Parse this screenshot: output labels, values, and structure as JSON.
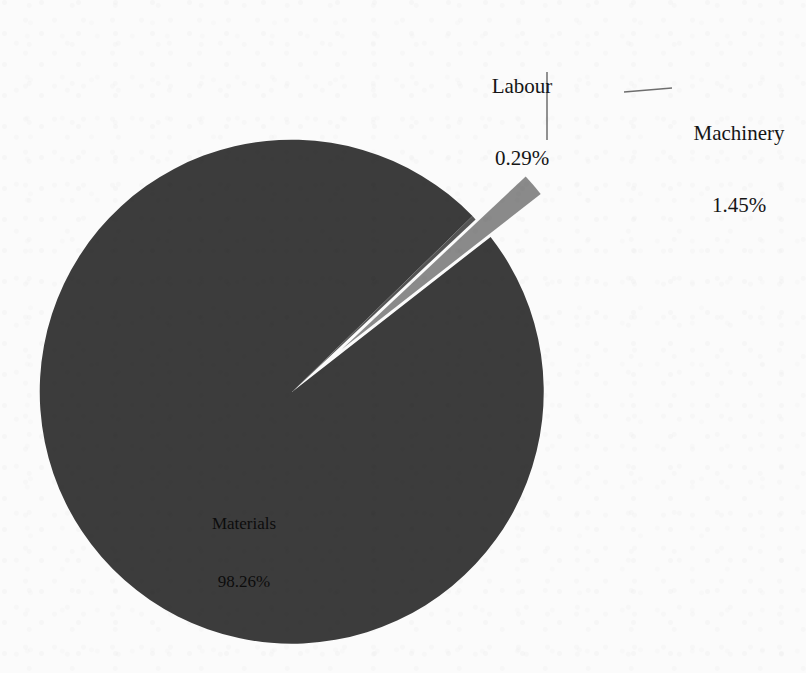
{
  "chart_data": {
    "type": "pie",
    "title": "",
    "subtitle": "",
    "xlabel": "",
    "ylabel": "",
    "legend_position": "none",
    "grid": false,
    "value_unit": "percent",
    "categories": [
      "Materials",
      "Machinery",
      "Labour"
    ],
    "values": [
      98.26,
      1.45,
      0.29
    ],
    "labels": [
      "Materials\n98.26%",
      "Machinery\n1.45%",
      "Labour\n0.29%"
    ],
    "slices": [
      {
        "name": "Materials",
        "value": 98.26,
        "value_text": "98.26%",
        "color": "#3c3c3c",
        "exploded": false,
        "label_placement": "inside"
      },
      {
        "name": "Machinery",
        "value": 1.45,
        "value_text": "1.45%",
        "color": "#8a8a8a",
        "exploded": true,
        "label_placement": "outside-leader"
      },
      {
        "name": "Labour",
        "value": 0.29,
        "value_text": "0.29%",
        "color": "#545454",
        "exploded": false,
        "label_placement": "outside-leader"
      }
    ]
  },
  "labels": {
    "labour": {
      "name": "Labour",
      "value": "0.29%"
    },
    "machinery": {
      "name": "Machinery",
      "value": "1.45%"
    },
    "materials": {
      "name": "Materials",
      "value": "98.26%"
    }
  },
  "colors": {
    "background": "#fbfbfb",
    "materials_slice": "#3c3c3c",
    "machinery_slice": "#8a8a8a",
    "labour_slice": "#545454",
    "leader_line": "#6e6e6e",
    "label_text": "#151515"
  }
}
